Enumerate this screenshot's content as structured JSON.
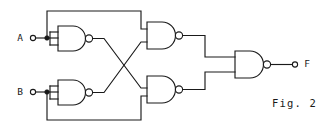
{
  "figure": {
    "caption": "Fig. 2",
    "caption_x": 272,
    "caption_y": 104,
    "background": "#ffffff",
    "line_color": "#1a1a1a",
    "width": 320,
    "height": 131
  },
  "inputs": [
    {
      "label": "A",
      "name": "input-a",
      "label_x": 20,
      "label_y": 38,
      "terminal_x": 33,
      "terminal_y": 38,
      "junction_x": 47,
      "junction_y": 38
    },
    {
      "label": "B",
      "name": "input-b",
      "label_x": 20,
      "label_y": 92,
      "terminal_x": 33,
      "terminal_y": 92,
      "junction_x": 47,
      "junction_y": 92
    }
  ],
  "outputs": [
    {
      "label": "F",
      "name": "output-f",
      "label_x": 305,
      "label_y": 64,
      "terminal_x": 295,
      "terminal_y": 64
    }
  ],
  "gates": [
    {
      "name": "nand-gate-1",
      "type": "NAND",
      "position": "top-left",
      "x": 58,
      "y": 26,
      "width": 30,
      "height": 25
    },
    {
      "name": "nand-gate-2",
      "type": "NAND",
      "position": "bottom-left",
      "x": 58,
      "y": 80,
      "width": 30,
      "height": 25
    },
    {
      "name": "nand-gate-3",
      "type": "NAND",
      "position": "top-right",
      "x": 147,
      "y": 22,
      "width": 30,
      "height": 27
    },
    {
      "name": "nand-gate-4",
      "type": "NAND",
      "position": "bottom-right",
      "x": 147,
      "y": 76,
      "width": 30,
      "height": 27
    },
    {
      "name": "nand-gate-5",
      "type": "NAND",
      "position": "output",
      "x": 235,
      "y": 51,
      "width": 30,
      "height": 27
    }
  ],
  "nets": [
    {
      "name": "net-a-to-gate1",
      "description": "A input to NAND gate 1 upper and lower inputs"
    },
    {
      "name": "net-a-feedback-top",
      "description": "A junction up and over to NAND gate 3 top input"
    },
    {
      "name": "net-b-to-gate2",
      "description": "B input to NAND gate 2 inputs"
    },
    {
      "name": "net-b-feedback-bottom",
      "description": "B junction down and over to NAND gate 4 bottom input"
    },
    {
      "name": "net-gate1-cross-to-gate4",
      "description": "NAND gate 1 output crosses down to NAND gate 4 top input"
    },
    {
      "name": "net-gate2-cross-to-gate3",
      "description": "NAND gate 2 output crosses up to NAND gate 3 bottom input"
    },
    {
      "name": "net-gate3-to-gate5",
      "description": "NAND gate 3 output right and down to NAND gate 5 top input"
    },
    {
      "name": "net-gate4-to-gate5",
      "description": "NAND gate 4 output right and up to NAND gate 5 bottom input"
    },
    {
      "name": "net-gate5-to-f",
      "description": "NAND gate 5 output to F terminal"
    }
  ]
}
